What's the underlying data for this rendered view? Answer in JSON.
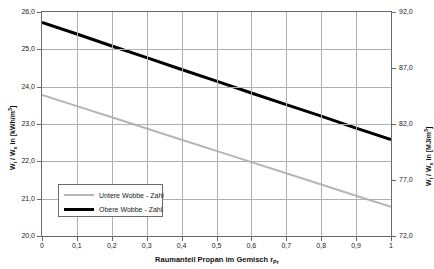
{
  "chart_data": {
    "type": "line",
    "title": "",
    "xlabel": "Raumanteil Propan im Gemisch r",
    "xlabel_sub": "Pr",
    "ylabel_left": "W",
    "ylabel_left_sub1": "i",
    "ylabel_left_mid": " / W",
    "ylabel_left_sub2": "s",
    "ylabel_left_unit": " in [kWh/m",
    "ylabel_left_sup": "3",
    "ylabel_left_end": "]",
    "ylabel_right": "W",
    "ylabel_right_sub1": "i",
    "ylabel_right_mid": " / W",
    "ylabel_right_sub2": "s",
    "ylabel_right_unit": " in [MJ/m",
    "ylabel_right_sup": "3",
    "ylabel_right_end": "]",
    "x": [
      0,
      0.1,
      0.2,
      0.3,
      0.4,
      0.5,
      0.6,
      0.7,
      0.8,
      0.9,
      1
    ],
    "xtick_labels": [
      "0",
      "0,1",
      "0,2",
      "0,3",
      "0,4",
      "0,5",
      "0,6",
      "0,7",
      "0,8",
      "0,9",
      "1"
    ],
    "xlim": [
      0,
      1
    ],
    "ylim_left": [
      20.0,
      26.0
    ],
    "ytick_left_labels": [
      "20,0",
      "21,0",
      "22,0",
      "23,0",
      "24,0",
      "25,0",
      "26,0"
    ],
    "ytick_left_values": [
      20.0,
      21.0,
      22.0,
      23.0,
      24.0,
      25.0,
      26.0
    ],
    "ylim_right": [
      72.0,
      92.0
    ],
    "ytick_right_labels": [
      "72,0",
      "77,0",
      "82,0",
      "87,0",
      "92,0"
    ],
    "ytick_right_values": [
      72.0,
      77.0,
      82.0,
      87.0,
      92.0
    ],
    "grid": true,
    "legend_position": "inner lower-left",
    "series": [
      {
        "name": "Untere Wobbe - Zahl",
        "color": "#b5b5b5",
        "width": 2,
        "values": [
          23.78,
          23.48,
          23.18,
          22.88,
          22.58,
          22.28,
          21.98,
          21.68,
          21.38,
          21.08,
          20.78
        ]
      },
      {
        "name": "Obere Wobbe - Zahl",
        "color": "#000000",
        "width": 3,
        "values": [
          25.72,
          25.41,
          25.09,
          24.78,
          24.46,
          24.15,
          23.83,
          23.52,
          23.21,
          22.89,
          22.58
        ]
      }
    ]
  },
  "legend": {
    "items": [
      {
        "label": "Untere Wobbe - Zahl",
        "swatch": "gray-line-swatch"
      },
      {
        "label": "Obere Wobbe - Zahl",
        "swatch": "black-line-swatch"
      }
    ]
  }
}
